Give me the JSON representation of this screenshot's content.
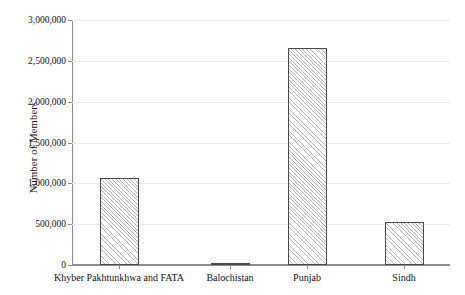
{
  "chart_data": {
    "type": "bar",
    "title": "",
    "xlabel": "",
    "ylabel": "Number of Members",
    "categories": [
      "Khyber Pakhtunkhwa and FATA",
      "Balochistan",
      "Punjab",
      "Sindh"
    ],
    "values": [
      1066000,
      25000,
      2660000,
      527000
    ],
    "ylim": [
      0,
      3000000
    ],
    "ytick_labels": [
      "0",
      "500,000",
      "1,000,000",
      "1,500,000",
      "2,000,000",
      "2,500,000",
      "3,000,000"
    ],
    "ytick_values": [
      0,
      500000,
      1000000,
      1500000,
      2000000,
      2500000,
      3000000
    ],
    "grid": true,
    "legend": "none",
    "bar_style": {
      "fill": "#ffffff",
      "hatch": "diagonal",
      "edge_color": "#4a4a4a"
    },
    "axis_color": "#8d8d8d",
    "gridline_color": "#ebebeb"
  }
}
